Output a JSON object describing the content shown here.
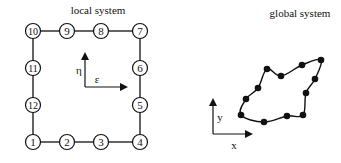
{
  "local": {
    "title": "local system",
    "axis_eta": "η",
    "axis_eps": "ε",
    "nodes": [
      {
        "label": "1",
        "x": 33,
        "y": 142
      },
      {
        "label": "2",
        "x": 67,
        "y": 142
      },
      {
        "label": "3",
        "x": 101,
        "y": 142
      },
      {
        "label": "4",
        "x": 140,
        "y": 142
      },
      {
        "label": "5",
        "x": 140,
        "y": 105
      },
      {
        "label": "6",
        "x": 140,
        "y": 68
      },
      {
        "label": "7",
        "x": 140,
        "y": 31
      },
      {
        "label": "8",
        "x": 101,
        "y": 31
      },
      {
        "label": "9",
        "x": 67,
        "y": 31
      },
      {
        "label": "10",
        "x": 33,
        "y": 31
      },
      {
        "label": "11",
        "x": 33,
        "y": 68
      },
      {
        "label": "12",
        "x": 33,
        "y": 105
      }
    ]
  },
  "global": {
    "title": "global system",
    "axis_y": "y",
    "axis_x": "x",
    "nodes": [
      {
        "x": 241,
        "y": 115
      },
      {
        "x": 264,
        "y": 122
      },
      {
        "x": 287,
        "y": 116
      },
      {
        "x": 303,
        "y": 115
      },
      {
        "x": 306,
        "y": 93
      },
      {
        "x": 315,
        "y": 79
      },
      {
        "x": 321,
        "y": 60
      },
      {
        "x": 302,
        "y": 65
      },
      {
        "x": 281,
        "y": 76
      },
      {
        "x": 267,
        "y": 69
      },
      {
        "x": 258,
        "y": 88
      },
      {
        "x": 246,
        "y": 99
      }
    ]
  }
}
